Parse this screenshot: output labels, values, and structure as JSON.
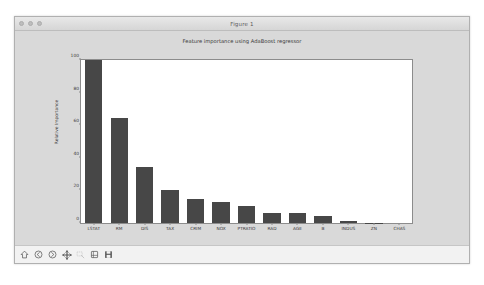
{
  "window": {
    "title": "Figure 1",
    "controls": [
      "close-button",
      "minimize-button",
      "zoom-button"
    ]
  },
  "toolbar": {
    "buttons": [
      {
        "name": "home-button",
        "label": "Home",
        "icon": "home-icon",
        "enabled": true
      },
      {
        "name": "back-button",
        "label": "Back",
        "icon": "back-arrow-icon",
        "enabled": true
      },
      {
        "name": "forward-button",
        "label": "Forward",
        "icon": "forward-arrow-icon",
        "enabled": true
      },
      {
        "name": "pan-button",
        "label": "Pan",
        "icon": "move-cross-icon",
        "enabled": true
      },
      {
        "name": "zoom-button",
        "label": "Zoom",
        "icon": "zoom-rect-icon",
        "enabled": false
      },
      {
        "name": "configure-button",
        "label": "Configure subplots",
        "icon": "sliders-icon",
        "enabled": true
      },
      {
        "name": "save-button",
        "label": "Save",
        "icon": "floppy-disk-icon",
        "enabled": true
      }
    ]
  },
  "colors": {
    "bar": "#474747",
    "axes_background": "#ffffff",
    "figure_background": "#d9d9d9",
    "axis_line": "#8c8c8c",
    "text": "#3a3a3a"
  },
  "chart_data": {
    "type": "bar",
    "title": "Feature importance using AdaBoost regressor",
    "xlabel": "",
    "ylabel": "Relative Importance",
    "ylim": [
      0,
      100
    ],
    "yticks": [
      0,
      20,
      40,
      60,
      80,
      100
    ],
    "grid": false,
    "legend": null,
    "categories": [
      "LSTAT",
      "RM",
      "DIS",
      "TAX",
      "CRIM",
      "NOX",
      "PTRATIO",
      "RAD",
      "AGE",
      "B",
      "INDUS",
      "ZN",
      "CHAS"
    ],
    "values": [
      100.0,
      64.5,
      34.5,
      20.5,
      15.0,
      12.8,
      10.5,
      6.2,
      6.0,
      4.0,
      1.5,
      0.3,
      0.0
    ]
  }
}
